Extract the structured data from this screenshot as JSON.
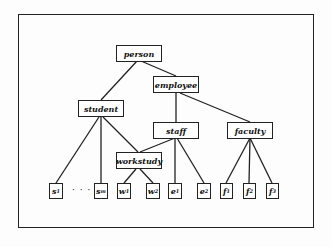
{
  "diagram": {
    "type": "class-hierarchy",
    "nodes": {
      "person": "person",
      "employee": "employee",
      "student": "student",
      "staff": "staff",
      "faculty": "faculty",
      "workstudy": "workstudy"
    },
    "leaves": {
      "s1": {
        "base": "s",
        "sub": "1"
      },
      "sm": {
        "base": "s",
        "sub": "m"
      },
      "w1": {
        "base": "w",
        "sub": "1"
      },
      "w2": {
        "base": "w",
        "sub": "2"
      },
      "e1": {
        "base": "e",
        "sub": "1"
      },
      "e2": {
        "base": "e",
        "sub": "2"
      },
      "f1": {
        "base": "f",
        "sub": "1"
      },
      "f2": {
        "base": "f",
        "sub": "2"
      },
      "f3": {
        "base": "f",
        "sub": "3"
      }
    },
    "ellipsis": "· · ·",
    "edges": [
      [
        "person",
        "student"
      ],
      [
        "person",
        "employee"
      ],
      [
        "employee",
        "staff"
      ],
      [
        "employee",
        "faculty"
      ],
      [
        "student",
        "s1"
      ],
      [
        "student",
        "sm"
      ],
      [
        "student",
        "workstudy"
      ],
      [
        "staff",
        "workstudy"
      ],
      [
        "staff",
        "e1"
      ],
      [
        "staff",
        "e2"
      ],
      [
        "workstudy",
        "w1"
      ],
      [
        "workstudy",
        "w2"
      ],
      [
        "faculty",
        "f1"
      ],
      [
        "faculty",
        "f2"
      ],
      [
        "faculty",
        "f3"
      ]
    ]
  }
}
